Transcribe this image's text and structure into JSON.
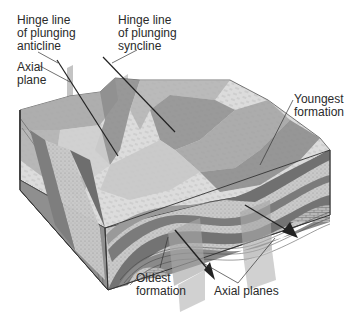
{
  "diagram": {
    "type": "geologic-block-diagram",
    "labels": {
      "hinge_anticline": "Hinge line\nof plunging\nanticline",
      "hinge_syncline": "Hinge line\nof plunging\nsyncline",
      "axial_plane": "Axial\nplane",
      "youngest": "Youngest\nformation",
      "oldest": "Oldest\nformation",
      "axial_planes": "Axial planes"
    },
    "colors": {
      "background": "#ffffff",
      "light_bed": "#d9d9d9",
      "mid_bed": "#a8a8a8",
      "dark_bed": "#7a7a7a",
      "darkest_bed": "#5e5e5e",
      "axial_plane": "#b5b5b5",
      "line": "#2a2a2a"
    }
  }
}
